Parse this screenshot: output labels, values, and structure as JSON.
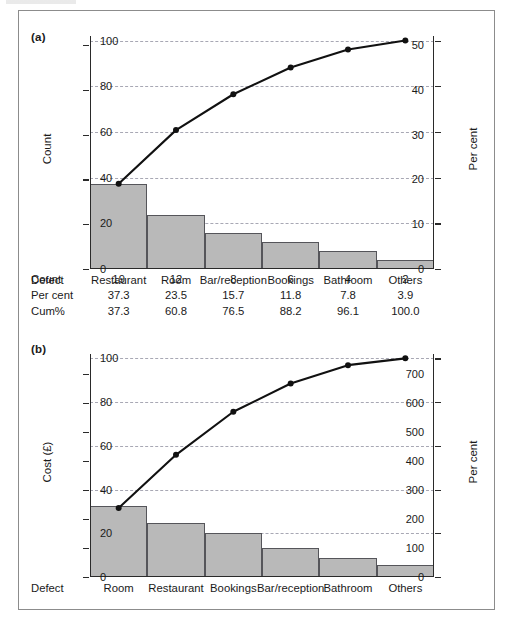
{
  "figure": {
    "panel_a_label": "(a)",
    "panel_b_label": "(b)",
    "defect_row_label": "Defect"
  },
  "chart_data": [
    {
      "id": "pareto-count",
      "type": "bar",
      "title": "(a)",
      "xlabel": "Defect",
      "ylabel": "Count",
      "y2label": "Per cent",
      "ylim": [
        0,
        52
      ],
      "y2lim": [
        0,
        102
      ],
      "yticks": [
        0,
        10,
        20,
        30,
        40,
        50
      ],
      "y2ticks": [
        0,
        20,
        40,
        60,
        80,
        100
      ],
      "grid": true,
      "categories": [
        "Restaurant",
        "Room",
        "Bar/reception",
        "Bookings",
        "Bathroom",
        "Others"
      ],
      "values": [
        19,
        12,
        8,
        6,
        4,
        2
      ],
      "series": [
        {
          "name": "Count",
          "values": [
            19,
            12,
            8,
            6,
            4,
            2
          ]
        },
        {
          "name": "Per cent",
          "values": [
            37.3,
            23.5,
            15.7,
            11.8,
            7.8,
            3.9
          ]
        },
        {
          "name": "Cum%",
          "values": [
            37.3,
            60.8,
            76.5,
            88.2,
            96.1,
            100.0
          ]
        }
      ],
      "table": {
        "row_labels": [
          "Count",
          "Per cent",
          "Cum%"
        ],
        "rows": [
          [
            "19",
            "12",
            "8",
            "6",
            "4",
            "2"
          ],
          [
            "37.3",
            "23.5",
            "15.7",
            "11.8",
            "7.8",
            "3.9"
          ],
          [
            "37.3",
            "60.8",
            "76.5",
            "88.2",
            "96.1",
            "100.0"
          ]
        ]
      }
    },
    {
      "id": "pareto-cost",
      "type": "bar",
      "title": "(b)",
      "xlabel": "Defect",
      "ylabel": "Cost (£)",
      "y2label": "Per cent",
      "ylim": [
        0,
        770
      ],
      "y2lim": [
        0,
        102
      ],
      "yticks": [
        0,
        100,
        200,
        300,
        400,
        500,
        600,
        700
      ],
      "y2ticks": [
        0,
        20,
        40,
        60,
        80,
        100
      ],
      "grid": true,
      "categories": [
        "Room",
        "Restaurant",
        "Bookings",
        "Bar/reception",
        "Bathroom",
        "Others"
      ],
      "values": [
        245,
        188,
        152,
        100,
        65,
        42
      ],
      "series": [
        {
          "name": "Cost (£)",
          "values": [
            245,
            188,
            152,
            100,
            65,
            42
          ]
        },
        {
          "name": "Cum%",
          "values": [
            31.6,
            55.9,
            75.6,
            88.5,
            96.9,
            100.0
          ]
        }
      ]
    }
  ],
  "axis_a": {
    "left_title": "Count",
    "right_title": "Per cent",
    "left_ticks": [
      "0",
      "10",
      "20",
      "30",
      "40",
      "50"
    ],
    "right_ticks": [
      "0",
      "20",
      "40",
      "60",
      "80",
      "100"
    ]
  },
  "axis_b": {
    "left_title": "Cost (£)",
    "right_title": "Per cent",
    "left_ticks": [
      "0",
      "100",
      "200",
      "300",
      "400",
      "500",
      "600",
      "700"
    ],
    "right_ticks": [
      "0",
      "20",
      "40",
      "60",
      "80",
      "100"
    ]
  }
}
